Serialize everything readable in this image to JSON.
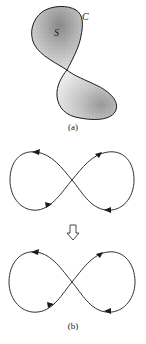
{
  "figure": {
    "panel_a": {
      "caption": "(a)",
      "surface_label": "S",
      "curve_label": "C",
      "description": "Two stippled lobes joined at a pinch point forming a closed surface S bounded by curve C"
    },
    "transition": {
      "arrow_icon": "down-outline-arrow",
      "glyph": "⇩"
    },
    "panel_b": {
      "caption": "(b)",
      "top_curve": {
        "shape": "figure-eight",
        "arrows": [
          {
            "position": "upper-left",
            "direction": "left"
          },
          {
            "position": "upper-right",
            "direction": "up-right"
          },
          {
            "position": "lower-left",
            "direction": "right"
          },
          {
            "position": "lower-right",
            "direction": "left"
          }
        ]
      },
      "bottom_curve": {
        "shape": "figure-eight",
        "arrows": [
          {
            "position": "upper-left",
            "direction": "left"
          },
          {
            "position": "upper-right",
            "direction": "up-right"
          },
          {
            "position": "lower-left",
            "direction": "right"
          },
          {
            "position": "lower-right",
            "direction": "left"
          }
        ]
      }
    },
    "colors": {
      "ink": "#1a1a1a",
      "stipple_dark": "#6e6e6e",
      "stipple_light": "#d6d6d6",
      "background": "#ffffff"
    }
  }
}
